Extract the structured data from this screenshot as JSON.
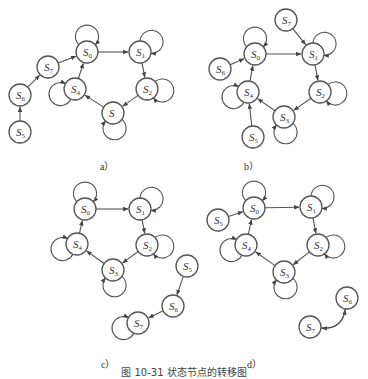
{
  "figure": {
    "caption": "图 10-31  状态节点的转移图",
    "node_radius": 11,
    "stroke_color": "#555555",
    "panels": [
      {
        "id": "a",
        "label": "a）",
        "label_pos": [
          100,
          158
        ],
        "nodes": [
          {
            "id": "S0",
            "main": "S",
            "sub": "0",
            "x": 87,
            "y": 52,
            "self_loop": "up"
          },
          {
            "id": "S1",
            "main": "S",
            "sub": "1",
            "x": 140,
            "y": 52,
            "self_loop": "upright"
          },
          {
            "id": "S2",
            "main": "S",
            "sub": "2",
            "x": 147,
            "y": 89,
            "self_loop": "right"
          },
          {
            "id": "S3",
            "main": "S",
            "sub": "",
            "x": 113,
            "y": 113,
            "self_loop": "down"
          },
          {
            "id": "S4",
            "main": "S",
            "sub": "4",
            "x": 75,
            "y": 89,
            "self_loop": "left"
          },
          {
            "id": "S5",
            "main": "S",
            "sub": "5",
            "x": 20,
            "y": 132,
            "self_loop": null
          },
          {
            "id": "S6",
            "main": "S",
            "sub": "6",
            "x": 20,
            "y": 95,
            "self_loop": null
          },
          {
            "id": "S7",
            "main": "S",
            "sub": "7",
            "x": 48,
            "y": 67,
            "self_loop": null
          }
        ],
        "edges": [
          [
            "S0",
            "S1"
          ],
          [
            "S1",
            "S2"
          ],
          [
            "S2",
            "S3"
          ],
          [
            "S3",
            "S4"
          ],
          [
            "S4",
            "S0"
          ],
          [
            "S5",
            "S6"
          ],
          [
            "S6",
            "S7"
          ],
          [
            "S7",
            "S0"
          ]
        ]
      },
      {
        "id": "b",
        "label": "b）",
        "label_pos": [
          244,
          158
        ],
        "nodes": [
          {
            "id": "S0",
            "main": "S",
            "sub": "0",
            "x": 255,
            "y": 54,
            "self_loop": "up"
          },
          {
            "id": "S1",
            "main": "S",
            "sub": "1",
            "x": 313,
            "y": 54,
            "self_loop": "upright"
          },
          {
            "id": "S2",
            "main": "S",
            "sub": "2",
            "x": 320,
            "y": 92,
            "self_loop": "right"
          },
          {
            "id": "S3",
            "main": "S",
            "sub": "3",
            "x": 284,
            "y": 117,
            "self_loop": "down"
          },
          {
            "id": "S4",
            "main": "S",
            "sub": "4",
            "x": 248,
            "y": 92,
            "self_loop": "left"
          },
          {
            "id": "S5",
            "main": "S",
            "sub": "5",
            "x": 253,
            "y": 137,
            "self_loop": null
          },
          {
            "id": "S6",
            "main": "S",
            "sub": "6",
            "x": 220,
            "y": 69,
            "self_loop": null
          },
          {
            "id": "S7",
            "main": "S",
            "sub": "7",
            "x": 286,
            "y": 20,
            "self_loop": null
          }
        ],
        "edges": [
          [
            "S0",
            "S1"
          ],
          [
            "S1",
            "S2"
          ],
          [
            "S2",
            "S3"
          ],
          [
            "S3",
            "S4"
          ],
          [
            "S4",
            "S0"
          ],
          [
            "S5",
            "S4"
          ],
          [
            "S6",
            "S0"
          ],
          [
            "S7",
            "S1"
          ]
        ]
      },
      {
        "id": "c",
        "label": "c）",
        "label_pos": [
          101,
          356
        ],
        "nodes": [
          {
            "id": "S0",
            "main": "S",
            "sub": "0",
            "x": 85,
            "y": 209,
            "self_loop": "up"
          },
          {
            "id": "S1",
            "main": "S",
            "sub": "1",
            "x": 140,
            "y": 209,
            "self_loop": "upright"
          },
          {
            "id": "S2",
            "main": "S",
            "sub": "2",
            "x": 147,
            "y": 245,
            "self_loop": "right"
          },
          {
            "id": "S3",
            "main": "S",
            "sub": "3",
            "x": 113,
            "y": 270,
            "self_loop": "down"
          },
          {
            "id": "S4",
            "main": "S",
            "sub": "4",
            "x": 77,
            "y": 244,
            "self_loop": "left"
          },
          {
            "id": "S5",
            "main": "S",
            "sub": "5",
            "x": 187,
            "y": 266,
            "self_loop": null
          },
          {
            "id": "S6",
            "main": "S",
            "sub": "6",
            "x": 173,
            "y": 306,
            "self_loop": null
          },
          {
            "id": "S7",
            "main": "S",
            "sub": "7",
            "x": 138,
            "y": 323,
            "self_loop": "left"
          }
        ],
        "edges": [
          [
            "S0",
            "S1"
          ],
          [
            "S1",
            "S2"
          ],
          [
            "S2",
            "S3"
          ],
          [
            "S3",
            "S4"
          ],
          [
            "S4",
            "S0"
          ],
          [
            "S5",
            "S6"
          ],
          [
            "S6",
            "S7"
          ]
        ]
      },
      {
        "id": "d",
        "label": "d）",
        "label_pos": [
          247,
          356
        ],
        "nodes": [
          {
            "id": "S0",
            "main": "S",
            "sub": "0",
            "x": 254,
            "y": 208,
            "self_loop": "up"
          },
          {
            "id": "S1",
            "main": "S",
            "sub": "1",
            "x": 311,
            "y": 207,
            "self_loop": "upright"
          },
          {
            "id": "S2",
            "main": "S",
            "sub": "2",
            "x": 318,
            "y": 245,
            "self_loop": "right"
          },
          {
            "id": "S3",
            "main": "S",
            "sub": "3",
            "x": 284,
            "y": 272,
            "self_loop": "down"
          },
          {
            "id": "S4",
            "main": "S",
            "sub": "4",
            "x": 246,
            "y": 245,
            "self_loop": "left"
          },
          {
            "id": "S5",
            "main": "S",
            "sub": "5",
            "x": 218,
            "y": 220,
            "self_loop": null
          },
          {
            "id": "S6",
            "main": "S",
            "sub": "6",
            "x": 347,
            "y": 298,
            "self_loop": null
          },
          {
            "id": "S7",
            "main": "S",
            "sub": "7",
            "x": 310,
            "y": 327,
            "self_loop": null
          }
        ],
        "edges": [
          [
            "S0",
            "S1"
          ],
          [
            "S1",
            "S2"
          ],
          [
            "S2",
            "S3"
          ],
          [
            "S3",
            "S4"
          ],
          [
            "S4",
            "S0"
          ],
          [
            "S5",
            "S0"
          ]
        ],
        "curved_edges": [
          [
            "S7",
            "S6",
            "left"
          ],
          [
            "S6",
            "S7",
            "right"
          ]
        ]
      }
    ]
  }
}
